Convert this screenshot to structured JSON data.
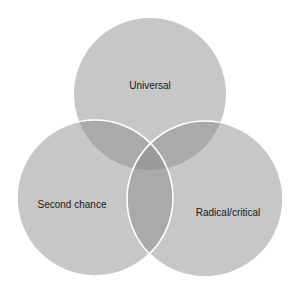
{
  "diagram": {
    "type": "venn",
    "background": "#ffffff",
    "circle_fill": "#8a8a8a",
    "circle_opacity": 0.48,
    "stroke_color": "#ffffff",
    "sets": [
      {
        "id": "universal",
        "label": "Universal",
        "cx": 150,
        "cy": 94,
        "r": 76,
        "label_x": 150,
        "label_y": 86,
        "stroke": false
      },
      {
        "id": "second-chance",
        "label": "Second chance",
        "cx": 95,
        "cy": 198,
        "r": 78,
        "label_x": 72,
        "label_y": 205,
        "stroke": true
      },
      {
        "id": "radical-critical",
        "label": "Radical/critical",
        "cx": 205,
        "cy": 199,
        "r": 78,
        "label_x": 228,
        "label_y": 213,
        "stroke": true
      }
    ]
  }
}
